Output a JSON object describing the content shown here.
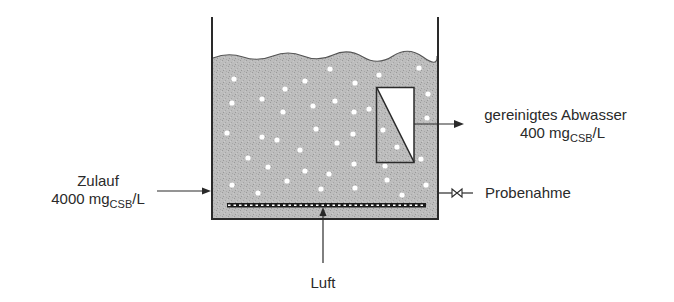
{
  "colors": {
    "line": "#2a2a2a",
    "liquid": "#b9b9b9",
    "liquid_speckle": "#9a9a9a",
    "bubble": "#ffffff",
    "membrane_fill": "#ffffff"
  },
  "inlet": {
    "label": "Zulauf",
    "value": "4000 mg",
    "unit_sub": "CSB",
    "unit_tail": "/L"
  },
  "outlet": {
    "label": "gereinigtes Abwasser",
    "value": "400 mg",
    "unit_sub": "CSB",
    "unit_tail": "/L"
  },
  "sampling": {
    "label": "Probenahme",
    "icon": "valve-icon"
  },
  "air": {
    "label": "Luft",
    "icon": "aerator-diffuser"
  },
  "tank": {
    "components": [
      "open-tank",
      "activated-sludge-liquid",
      "air-bubbles",
      "membrane-module",
      "aeration-diffuser"
    ]
  }
}
